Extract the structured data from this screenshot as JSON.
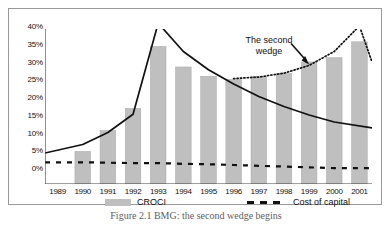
{
  "chart_data": {
    "type": "bar",
    "title": "",
    "xlabel": "",
    "ylabel": "",
    "ylim": [
      0,
      40
    ],
    "ytick_labels": [
      "40%",
      "35%",
      "30%",
      "25%",
      "20%",
      "15%",
      "10%",
      "5%",
      "0%"
    ],
    "ytick_values": [
      40,
      35,
      30,
      25,
      20,
      15,
      10,
      5,
      0
    ],
    "grid": false,
    "legend_position": "bottom",
    "categories": [
      "1989",
      "1990",
      "1991",
      "1992",
      "1993",
      "1994",
      "1995",
      "1996",
      "1997",
      "1998",
      "1999",
      "2000",
      "2001"
    ],
    "series": [
      {
        "name": "CROCI",
        "type": "bar",
        "color": "#bfbfbf",
        "values": [
          null,
          8.4,
          13.8,
          19.5,
          35.5,
          30.2,
          27.8,
          27.0,
          27.8,
          28.5,
          31.5,
          32.6,
          36.7
        ]
      },
      {
        "name": "Cost of capital",
        "type": "line",
        "style": "dashed",
        "color": "#111111",
        "values": [
          5.6,
          5.6,
          5.5,
          5.4,
          5.4,
          5.2,
          5.1,
          4.9,
          4.7,
          4.5,
          4.3,
          4.1,
          4.1
        ]
      },
      {
        "name": "First wedge curve",
        "type": "line",
        "style": "solid",
        "color": "#111111",
        "values": [
          8.0,
          10.2,
          13.3,
          18.0,
          41.5,
          34.2,
          29.5,
          25.8,
          22.6,
          20.0,
          17.8,
          16.0,
          14.5
        ]
      },
      {
        "name": "The second wedge curve",
        "type": "line",
        "style": "dotted",
        "color": "#111111",
        "values": [
          null,
          null,
          null,
          null,
          null,
          null,
          null,
          27.2,
          27.6,
          28.6,
          30.6,
          34.2,
          40.8
        ]
      }
    ],
    "annotations": [
      {
        "text_line1": "The second",
        "text_line2": "wedge",
        "target_category": "1999",
        "target_value": 30.6
      }
    ]
  },
  "legend": {
    "items": [
      {
        "label": "CROCI",
        "marker": "filled-bar",
        "color": "#bfbfbf"
      },
      {
        "label": "Cost of capital",
        "marker": "dashed-line",
        "color": "#111111"
      }
    ]
  },
  "caption": {
    "text": "Figure 2.1 BMG: the second wedge begins"
  }
}
